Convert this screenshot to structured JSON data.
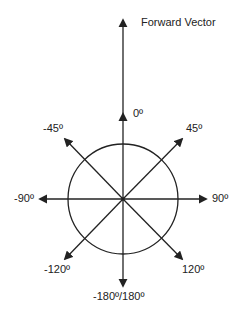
{
  "diagram": {
    "title": "Forward Vector",
    "center_label": "0º",
    "labels": {
      "forward": "Forward Vector",
      "zero": "0º",
      "minus45": "-45º",
      "plus45": "45º",
      "minus90": "-90º",
      "plus90": "90º",
      "minus120": "-120º",
      "plus120": "120º",
      "back": "-180º/180º"
    },
    "colors": {
      "line": "#222222",
      "background": "#ffffff"
    }
  }
}
